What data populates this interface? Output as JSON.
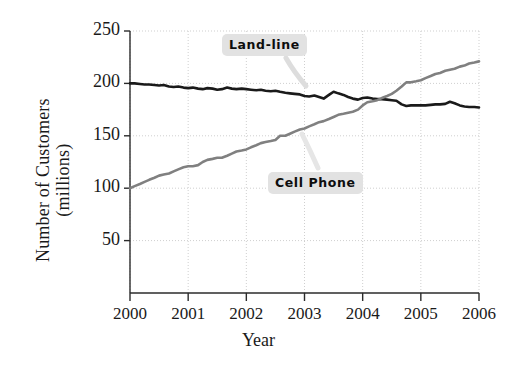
{
  "chart_data": {
    "type": "line",
    "title": "",
    "xlabel": "Year",
    "ylabel": "Number of Customers\n(millions)",
    "xlim": [
      2000,
      2006
    ],
    "ylim": [
      0,
      250
    ],
    "yticks": [
      50,
      100,
      150,
      200,
      250
    ],
    "xticks": [
      2000,
      2001,
      2002,
      2003,
      2004,
      2005,
      2006
    ],
    "xtick_labels": [
      "2000",
      "2001",
      "2002",
      "2003",
      "2004",
      "2005",
      "2006"
    ],
    "ytick_labels": [
      "50",
      "100",
      "150",
      "200",
      "250"
    ],
    "grid": true,
    "legend_position": "inline-annotations",
    "series": [
      {
        "name": "Land-line",
        "color": "#1a1a1a",
        "label_text": "Land-line",
        "x": [
          2000.0,
          2000.08,
          2000.17,
          2000.25,
          2000.33,
          2000.42,
          2000.5,
          2000.58,
          2000.67,
          2000.75,
          2000.83,
          2000.92,
          2001.0,
          2001.08,
          2001.17,
          2001.25,
          2001.33,
          2001.42,
          2001.5,
          2001.58,
          2001.67,
          2001.75,
          2001.83,
          2001.92,
          2002.0,
          2002.08,
          2002.17,
          2002.25,
          2002.33,
          2002.42,
          2002.5,
          2002.58,
          2002.67,
          2002.75,
          2002.83,
          2002.92,
          2003.0,
          2003.08,
          2003.17,
          2003.25,
          2003.33,
          2003.42,
          2003.5,
          2003.58,
          2003.67,
          2003.75,
          2003.83,
          2003.92,
          2004.0,
          2004.08,
          2004.17,
          2004.25,
          2004.33,
          2004.42,
          2004.5,
          2004.58,
          2004.67,
          2004.75,
          2004.83,
          2004.92,
          2005.0,
          2005.08,
          2005.17,
          2005.25,
          2005.33,
          2005.42,
          2005.5,
          2005.58,
          2005.67,
          2005.75,
          2005.83,
          2005.92,
          2006.0
        ],
        "values": [
          200,
          200,
          199.5,
          199,
          199,
          198.5,
          198,
          198.5,
          197,
          196.5,
          197,
          196,
          195.5,
          196,
          195,
          194.5,
          195.5,
          195,
          194,
          194.5,
          196,
          195,
          194.5,
          195,
          194.5,
          194,
          193.5,
          194,
          193,
          192.5,
          193,
          192,
          191,
          190.5,
          190,
          189.5,
          188,
          187.5,
          188.5,
          187,
          185.5,
          189,
          192,
          190.5,
          189,
          187,
          185.5,
          184.5,
          186,
          186.5,
          185.5,
          185,
          185,
          184.5,
          184,
          183.5,
          180,
          178.5,
          179,
          179,
          179,
          179,
          179.5,
          180,
          180,
          180.5,
          182.5,
          181,
          179,
          178,
          177.5,
          177.5,
          177
        ]
      },
      {
        "name": "Cell Phone",
        "color": "#808080",
        "label_text": "Cell Phone",
        "x": [
          2000.0,
          2000.08,
          2000.17,
          2000.25,
          2000.33,
          2000.42,
          2000.5,
          2000.58,
          2000.67,
          2000.75,
          2000.83,
          2000.92,
          2001.0,
          2001.08,
          2001.17,
          2001.25,
          2001.33,
          2001.42,
          2001.5,
          2001.58,
          2001.67,
          2001.75,
          2001.83,
          2001.92,
          2002.0,
          2002.08,
          2002.17,
          2002.25,
          2002.33,
          2002.42,
          2002.5,
          2002.58,
          2002.67,
          2002.75,
          2002.83,
          2002.92,
          2003.0,
          2003.08,
          2003.17,
          2003.25,
          2003.33,
          2003.42,
          2003.5,
          2003.58,
          2003.67,
          2003.75,
          2003.83,
          2003.92,
          2004.0,
          2004.08,
          2004.17,
          2004.25,
          2004.33,
          2004.42,
          2004.5,
          2004.58,
          2004.67,
          2004.75,
          2004.83,
          2004.92,
          2005.0,
          2005.08,
          2005.17,
          2005.25,
          2005.33,
          2005.42,
          2005.5,
          2005.58,
          2005.67,
          2005.75,
          2005.83,
          2005.92,
          2006.0
        ],
        "values": [
          100,
          102,
          104,
          106,
          108,
          110,
          112,
          113,
          114,
          116,
          118,
          120,
          121,
          121,
          122,
          125,
          127,
          128,
          129,
          129,
          131,
          133,
          135,
          136,
          137,
          139,
          141,
          143,
          144,
          145,
          146,
          150,
          150,
          152,
          154,
          156,
          157,
          159,
          161,
          163,
          164,
          166,
          168,
          170,
          171,
          172,
          173,
          175,
          179,
          182,
          183,
          184,
          186,
          188,
          190,
          193,
          197,
          201,
          201,
          202,
          203,
          205,
          207,
          209,
          210,
          212,
          213,
          214,
          216,
          217,
          219,
          220,
          221
        ]
      }
    ],
    "annotations": [
      {
        "text": "Land-line",
        "series": "Land-line"
      },
      {
        "text": "Cell Phone",
        "series": "Cell Phone"
      }
    ]
  },
  "plot_geometry": {
    "left": 130,
    "right": 479,
    "top": 31,
    "bottom": 293,
    "y_value_at_top_tick": 250,
    "y_value_at_bottom_axis": 0
  },
  "labels": {
    "land_line_pos": {
      "left": 222,
      "top": 34
    },
    "cell_phone_pos": {
      "left": 268,
      "top": 172
    }
  },
  "colors": {
    "land_line": "#1a1a1a",
    "cell_phone": "#808080",
    "grid": "#cfcfcf",
    "axis": "#2b2b2b",
    "label_bg": "#e2e2e2",
    "background": "#ffffff"
  }
}
